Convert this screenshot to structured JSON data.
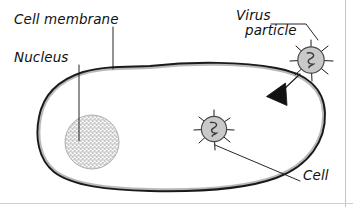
{
  "diagram": {
    "background_color": "#ffffff",
    "labels": {
      "cell_membrane": "Cell membrane",
      "nucleus": "Nucleus",
      "virus_particle_line1": "Virus",
      "virus_particle_line2": "particle",
      "cell": "Cell"
    },
    "colors": {
      "ink": "#1a1a1a",
      "membrane_band": "#b9b9b9",
      "virus_fill": "#c9c9c9",
      "nucleus_fill": "#b5b5b5",
      "arrow_fill": "#111111",
      "scan_border": "#c4c4c4"
    },
    "parts": [
      {
        "name": "cell",
        "kind": "outline",
        "label": "Cell"
      },
      {
        "name": "cell-membrane",
        "kind": "boundary",
        "label": "Cell membrane"
      },
      {
        "name": "nucleus",
        "kind": "stippled-circle",
        "label": "Nucleus"
      },
      {
        "name": "virus-particle-outside",
        "kind": "spiked-circle",
        "label": "Virus particle"
      },
      {
        "name": "virus-particle-inside",
        "kind": "spiked-circle",
        "label": "Virus particle"
      },
      {
        "name": "entry-arrow",
        "kind": "arrowhead",
        "label": "virus entering cell"
      }
    ],
    "icons": {
      "virus": "virus-particle-icon",
      "nucleus": "nucleus-icon",
      "arrow": "arrowhead-icon"
    }
  }
}
